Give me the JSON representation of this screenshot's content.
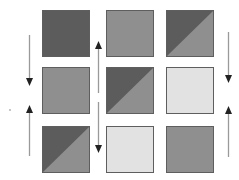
{
  "diagram": {
    "type": "tile-state-grid",
    "colors": {
      "dark": "#5c5c5c",
      "medium": "#8f8f8f",
      "light": "#e2e2e2",
      "border": "#5e5e5e",
      "arrow": "#9a9a9a",
      "arrowhead": "#222222"
    },
    "grid": {
      "rows": 3,
      "cols": 3,
      "tiles": [
        {
          "row": 0,
          "col": 0,
          "fill": "dark"
        },
        {
          "row": 0,
          "col": 1,
          "fill": "medium"
        },
        {
          "row": 0,
          "col": 2,
          "fill": "split-dark-medium"
        },
        {
          "row": 1,
          "col": 0,
          "fill": "medium"
        },
        {
          "row": 1,
          "col": 1,
          "fill": "split-dark-medium"
        },
        {
          "row": 1,
          "col": 2,
          "fill": "light"
        },
        {
          "row": 2,
          "col": 0,
          "fill": "split-dark-medium"
        },
        {
          "row": 2,
          "col": 1,
          "fill": "light"
        },
        {
          "row": 2,
          "col": 2,
          "fill": "medium"
        }
      ]
    },
    "arrows": [
      {
        "position": "left-column-upper",
        "direction": "down"
      },
      {
        "position": "left-column-lower",
        "direction": "up"
      },
      {
        "position": "middle-gap-upper",
        "direction": "up"
      },
      {
        "position": "middle-gap-lower",
        "direction": "down"
      },
      {
        "position": "right-column-upper",
        "direction": "down"
      },
      {
        "position": "right-column-lower",
        "direction": "up"
      }
    ]
  }
}
